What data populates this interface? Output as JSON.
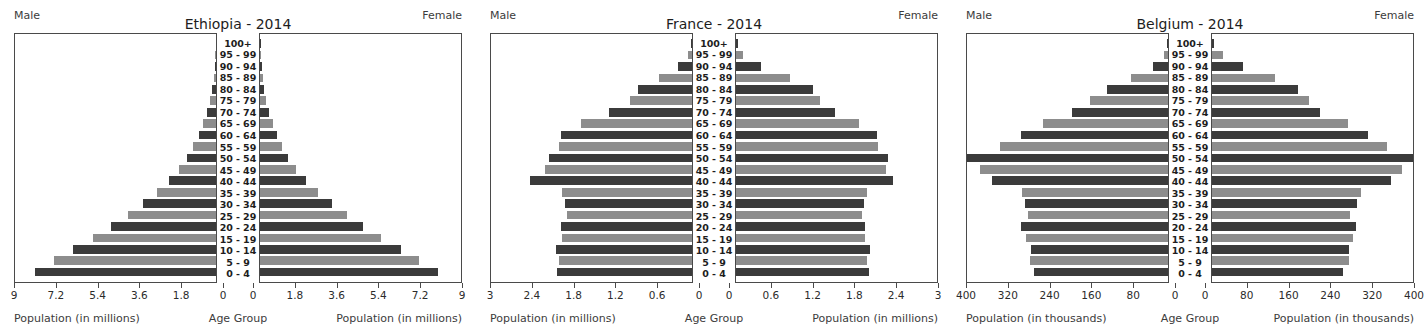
{
  "figure": {
    "side_labels": {
      "male": "Male",
      "female": "Female"
    },
    "center_caption": "Age Group",
    "age_groups": [
      "100+",
      "95 - 99",
      "90 - 94",
      "85 - 89",
      "80 - 84",
      "75 - 79",
      "70 - 74",
      "65 - 69",
      "60 - 64",
      "55 - 59",
      "50 - 54",
      "45 - 49",
      "40 - 44",
      "35 - 39",
      "30 - 34",
      "25 - 29",
      "20 - 24",
      "15 - 19",
      "10 - 14",
      "5 - 9",
      "0 - 4"
    ],
    "colors": {
      "dark_bar": "#3b3b3b",
      "light_bar": "#8d8d8d",
      "frame": "#4a4a4a",
      "text": "#2b2b2b"
    }
  },
  "panels": [
    {
      "title": "Ethiopia - 2014",
      "axis_caption": "Population (in millions)",
      "unit": "millions",
      "max": 9,
      "ticks": [
        9,
        7.2,
        5.4,
        3.6,
        1.8,
        0
      ],
      "ticks_right": [
        0,
        1.8,
        3.6,
        5.4,
        7.2,
        9
      ]
    },
    {
      "title": "France - 2014",
      "axis_caption": "Population (in millions)",
      "unit": "millions",
      "max": 3,
      "ticks": [
        3,
        2.4,
        1.8,
        1.2,
        0.6,
        0
      ],
      "ticks_right": [
        0,
        0.6,
        1.2,
        1.8,
        2.4,
        3
      ]
    },
    {
      "title": "Belgium - 2014",
      "axis_caption": "Population (in thousands)",
      "unit": "thousands",
      "max": 400,
      "ticks": [
        400,
        320,
        240,
        160,
        80,
        0
      ],
      "ticks_right": [
        0,
        80,
        160,
        240,
        320,
        400
      ]
    }
  ],
  "chart_data": [
    {
      "type": "bar",
      "title": "Ethiopia - 2014",
      "subtitle": "Population pyramid",
      "xlabel": "Population (in millions)",
      "ylabel": "Age Group",
      "xlim": [
        0,
        9
      ],
      "grid": false,
      "legend": [
        "Male",
        "Female"
      ],
      "legend_position": "top-left / top-right",
      "categories": [
        "100+",
        "95 - 99",
        "90 - 94",
        "85 - 89",
        "80 - 84",
        "75 - 79",
        "70 - 74",
        "65 - 69",
        "60 - 64",
        "55 - 59",
        "50 - 54",
        "45 - 49",
        "40 - 44",
        "35 - 39",
        "30 - 34",
        "25 - 29",
        "20 - 24",
        "15 - 19",
        "10 - 14",
        "5 - 9",
        "0 - 4"
      ],
      "series": [
        {
          "name": "Male",
          "values": [
            0.003,
            0.02,
            0.05,
            0.09,
            0.17,
            0.26,
            0.4,
            0.56,
            0.77,
            1.0,
            1.3,
            1.65,
            2.1,
            2.62,
            3.25,
            3.95,
            4.7,
            5.5,
            6.4,
            7.25,
            8.1
          ]
        },
        {
          "name": "Female",
          "values": [
            0.004,
            0.02,
            0.06,
            0.1,
            0.18,
            0.27,
            0.4,
            0.55,
            0.75,
            0.98,
            1.26,
            1.6,
            2.05,
            2.58,
            3.2,
            3.9,
            4.62,
            5.42,
            6.3,
            7.1,
            7.95
          ]
        }
      ]
    },
    {
      "type": "bar",
      "title": "France - 2014",
      "subtitle": "Population pyramid",
      "xlabel": "Population (in millions)",
      "ylabel": "Age Group",
      "xlim": [
        0,
        3
      ],
      "grid": false,
      "legend": [
        "Male",
        "Female"
      ],
      "legend_position": "top-left / top-right",
      "categories": [
        "100+",
        "95 - 99",
        "90 - 94",
        "85 - 89",
        "80 - 84",
        "75 - 79",
        "70 - 74",
        "65 - 69",
        "60 - 64",
        "55 - 59",
        "50 - 54",
        "45 - 49",
        "40 - 44",
        "35 - 39",
        "30 - 34",
        "25 - 29",
        "20 - 24",
        "15 - 19",
        "10 - 14",
        "5 - 9",
        "0 - 4"
      ],
      "series": [
        {
          "name": "Male",
          "values": [
            0.01,
            0.05,
            0.2,
            0.49,
            0.8,
            0.92,
            1.24,
            1.65,
            1.95,
            1.98,
            2.14,
            2.2,
            2.42,
            1.94,
            1.89,
            1.87,
            1.96,
            1.94,
            2.03,
            1.98,
            2.01
          ]
        },
        {
          "name": "Female",
          "values": [
            0.03,
            0.1,
            0.37,
            0.8,
            1.15,
            1.25,
            1.47,
            1.83,
            2.1,
            2.12,
            2.26,
            2.24,
            2.34,
            1.95,
            1.91,
            1.88,
            1.92,
            1.92,
            2.0,
            1.96,
            1.99
          ]
        }
      ]
    },
    {
      "type": "bar",
      "title": "Belgium - 2014",
      "subtitle": "Population pyramid",
      "xlabel": "Population (in thousands)",
      "ylabel": "Age Group",
      "xlim": [
        0,
        400
      ],
      "grid": false,
      "legend": [
        "Male",
        "Female"
      ],
      "legend_position": "top-left / top-right",
      "categories": [
        "100+",
        "95 - 99",
        "90 - 94",
        "85 - 89",
        "80 - 84",
        "75 - 79",
        "70 - 74",
        "65 - 69",
        "60 - 64",
        "55 - 59",
        "50 - 54",
        "45 - 49",
        "40 - 44",
        "35 - 39",
        "30 - 34",
        "25 - 29",
        "20 - 24",
        "15 - 19",
        "10 - 14",
        "5 - 9",
        "0 - 4"
      ],
      "series": [
        {
          "name": "Male",
          "values": [
            1,
            8,
            30,
            73,
            120,
            155,
            190,
            248,
            292,
            334,
            400,
            374,
            350,
            290,
            285,
            279,
            293,
            282,
            272,
            275,
            267
          ]
        },
        {
          "name": "Female",
          "values": [
            4,
            22,
            62,
            125,
            170,
            192,
            214,
            270,
            310,
            348,
            400,
            378,
            357,
            297,
            288,
            275,
            286,
            280,
            272,
            272,
            261
          ]
        }
      ]
    }
  ]
}
